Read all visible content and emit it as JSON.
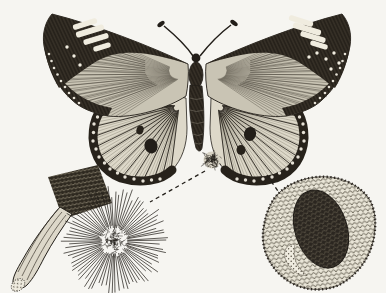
{
  "meta": {
    "alt": "Black-and-white book engraving of a butterfly with spread wings, dorsal view. Dashed leader lines connect the insect to two magnified details: a scent brush (hair-pencil) with a radiating starburst of fine hairs at lower left, and a magnified patch of overlapping wing scales with a dark oval scent spot at lower right.",
    "figure_type": "engraving-illustration"
  },
  "palette": {
    "paper": "#f6f5f1",
    "paper_bright": "#f0ecdf",
    "ink": "#221e19",
    "dark": "#27221b",
    "mid": "#3f3a31",
    "soft": "#55503f",
    "wing_disc": "#c9c4b4",
    "hind_disc": "#ddd8c9",
    "handle_fill": "#ddd8ca"
  },
  "parts": {
    "butterfly": "butterfly, dorsal view, spread wings",
    "left_detail": "hair-pencil brush and spread tuft of hairs",
    "right_detail": "magnified wing scales with androconial spot"
  },
  "connectors": {
    "dash": "4 3.5",
    "left": {
      "x1": 205,
      "y1": 171,
      "x2": 150,
      "y2": 202
    },
    "right": {
      "x1": 267,
      "y1": 175,
      "x2": 286,
      "y2": 203
    }
  },
  "art": {
    "fans": [
      {
        "grp": "fan-lf",
        "base": [
          186,
          74
        ],
        "edge": [
          [
            52,
            16
          ],
          [
            44,
            46
          ],
          [
            56,
            84
          ],
          [
            72,
            100
          ],
          [
            95,
            112
          ],
          [
            120,
            117
          ]
        ],
        "n": 34,
        "stroke": "#3f3a31",
        "w": 0.6,
        "o": 0.6,
        "start": 0.12
      },
      {
        "grp": "fan-lf2",
        "base": [
          186,
          74
        ],
        "edge": [
          [
            50,
            30
          ],
          [
            50,
            70
          ],
          [
            66,
            96
          ],
          [
            90,
            110
          ]
        ],
        "n": 16,
        "stroke": "#27221b",
        "w": 0.8,
        "o": 0.5,
        "start": 0.3
      },
      {
        "grp": "fan-rf",
        "base": [
          210,
          74
        ],
        "edge": [
          [
            342,
            16
          ],
          [
            350,
            46
          ],
          [
            338,
            84
          ],
          [
            322,
            100
          ],
          [
            299,
            112
          ],
          [
            274,
            117
          ]
        ],
        "n": 34,
        "stroke": "#3f3a31",
        "w": 0.6,
        "o": 0.6,
        "start": 0.12
      },
      {
        "grp": "fan-rf2",
        "base": [
          210,
          74
        ],
        "edge": [
          [
            344,
            30
          ],
          [
            344,
            70
          ],
          [
            328,
            96
          ],
          [
            304,
            110
          ]
        ],
        "n": 16,
        "stroke": "#27221b",
        "w": 0.8,
        "o": 0.5,
        "start": 0.3
      },
      {
        "grp": "fan-lh",
        "base": [
          179,
          106
        ],
        "edge": [
          [
            113,
            102
          ],
          [
            97,
            116
          ],
          [
            93,
            138
          ],
          [
            99,
            158
          ],
          [
            113,
            173
          ],
          [
            133,
            181
          ],
          [
            156,
            181
          ],
          [
            171,
            170
          ]
        ],
        "n": 15,
        "stroke": "#221e19",
        "w": 0.9,
        "o": 0.95,
        "start": 0.06
      },
      {
        "grp": "fan-lh2",
        "base": [
          179,
          106
        ],
        "edge": [
          [
            113,
            102
          ],
          [
            97,
            116
          ],
          [
            93,
            138
          ],
          [
            99,
            158
          ],
          [
            113,
            173
          ],
          [
            133,
            181
          ],
          [
            156,
            181
          ],
          [
            171,
            170
          ]
        ],
        "n": 44,
        "stroke": "#55503f",
        "w": 0.45,
        "o": 0.6,
        "start": 0.1
      },
      {
        "grp": "fan-rh",
        "base": [
          218,
          106
        ],
        "edge": [
          [
            284,
            102
          ],
          [
            300,
            116
          ],
          [
            304,
            138
          ],
          [
            298,
            158
          ],
          [
            284,
            173
          ],
          [
            264,
            181
          ],
          [
            241,
            181
          ],
          [
            226,
            170
          ]
        ],
        "n": 15,
        "stroke": "#221e19",
        "w": 0.9,
        "o": 0.95,
        "start": 0.06
      },
      {
        "grp": "fan-rh2",
        "base": [
          218,
          106
        ],
        "edge": [
          [
            284,
            102
          ],
          [
            300,
            116
          ],
          [
            304,
            138
          ],
          [
            298,
            158
          ],
          [
            284,
            173
          ],
          [
            264,
            181
          ],
          [
            241,
            181
          ],
          [
            226,
            170
          ]
        ],
        "n": 44,
        "stroke": "#55503f",
        "w": 0.45,
        "o": 0.6,
        "start": 0.1
      }
    ],
    "dot_rows": [
      {
        "grp": "dots-lh",
        "pts": [
          [
            101,
            110
          ],
          [
            94,
            124
          ],
          [
            93,
            141
          ],
          [
            99,
            157
          ],
          [
            110,
            169
          ],
          [
            125,
            177
          ],
          [
            143,
            181
          ],
          [
            160,
            179
          ]
        ],
        "r": 1.7,
        "fill": "#efebdf"
      },
      {
        "grp": "dots-rh",
        "pts": [
          [
            296,
            110
          ],
          [
            303,
            124
          ],
          [
            304,
            141
          ],
          [
            298,
            157
          ],
          [
            287,
            169
          ],
          [
            272,
            177
          ],
          [
            254,
            181
          ],
          [
            237,
            179
          ]
        ],
        "r": 1.7,
        "fill": "#efebdf"
      },
      {
        "grp": "dots-lf",
        "pts": [
          [
            49,
            54
          ],
          [
            54,
            68
          ],
          [
            61,
            81
          ],
          [
            69,
            93
          ],
          [
            79,
            103
          ]
        ],
        "r": 1.3,
        "fill": "#efebdf"
      },
      {
        "grp": "dots-rf",
        "pts": [
          [
            345,
            54
          ],
          [
            340,
            68
          ],
          [
            333,
            81
          ],
          [
            325,
            93
          ],
          [
            315,
            103
          ]
        ],
        "r": 1.3,
        "fill": "#efebdf"
      }
    ],
    "white_bars": {
      "left": [
        [
          85,
          24,
          25,
          5.5,
          -17
        ],
        [
          90,
          31,
          29,
          6,
          -17
        ],
        [
          96,
          39,
          26,
          5.5,
          -17
        ],
        [
          102,
          47,
          18,
          5,
          -17
        ]
      ],
      "right": [
        [
          301,
          21,
          25,
          5.5,
          17
        ],
        [
          307,
          29,
          29,
          6,
          17
        ],
        [
          313,
          37,
          26,
          5.5,
          17
        ],
        [
          319,
          45,
          18,
          5,
          17
        ]
      ]
    },
    "white_specks": {
      "left": [
        [
          74,
          56
        ],
        [
          80,
          65
        ],
        [
          67,
          47
        ]
      ],
      "right": [
        [
          317,
          53
        ],
        [
          326,
          59
        ],
        [
          309,
          57
        ],
        [
          334,
          53
        ],
        [
          339,
          63
        ],
        [
          331,
          69
        ]
      ]
    },
    "starburst": {
      "cx": 114,
      "cy": 241,
      "rays": 82,
      "rIn": 12,
      "rOutMin": 43,
      "rOutMax": 55,
      "w": 0.8,
      "stroke": "#221e19"
    },
    "core": {
      "cx": 114,
      "cy": 241,
      "r": 12,
      "strokes": 90,
      "stroke": "#221e19"
    },
    "tuft": {
      "cx": 212,
      "cy": 160,
      "r": 8.5,
      "strokes": 80,
      "stroke": "#221e19",
      "base_fill": "#d8d3c5"
    }
  }
}
